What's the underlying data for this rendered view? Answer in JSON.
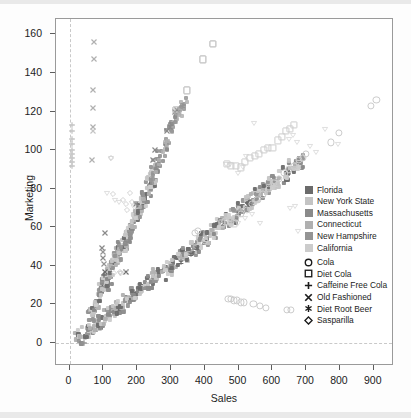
{
  "chart": {
    "type": "scatter",
    "title": "",
    "xlabel": "Sales",
    "ylabel": "Marketing"
  },
  "axes": {
    "x": {
      "label": "Sales",
      "min": -40,
      "max": 960,
      "ticks": [
        0,
        100,
        200,
        300,
        400,
        500,
        600,
        700,
        800,
        900
      ]
    },
    "y": {
      "label": "Marketing",
      "min": -12,
      "max": 168,
      "ticks": [
        0,
        20,
        40,
        60,
        80,
        100,
        120,
        140,
        160
      ]
    },
    "reference_lines": {
      "x_at": 0,
      "y_at": 0
    }
  },
  "legend": {
    "position": "inside-right",
    "color_groups": [
      {
        "label": "Florida",
        "color": "#6b6b6b"
      },
      {
        "label": "New York State",
        "color": "#c4c4c4"
      },
      {
        "label": "Massachusetts",
        "color": "#8a8a8a"
      },
      {
        "label": "Connecticut",
        "color": "#b0b0b0"
      },
      {
        "label": "New Hampshire",
        "color": "#949494"
      },
      {
        "label": "California",
        "color": "#cccccc"
      }
    ],
    "shape_groups": [
      {
        "label": "Cola",
        "symbol": "circle",
        "icon": "circle-icon"
      },
      {
        "label": "Diet Cola",
        "symbol": "square",
        "icon": "square-icon"
      },
      {
        "label": "Caffeine Free Cola",
        "symbol": "plus",
        "icon": "plus-icon"
      },
      {
        "label": "Old Fashioned",
        "symbol": "x",
        "icon": "x-icon"
      },
      {
        "label": "Diet Root Beer",
        "symbol": "asterisk",
        "icon": "asterisk-icon"
      },
      {
        "label": "Sasparilla",
        "symbol": "diamond",
        "icon": "diamond-icon"
      }
    ]
  },
  "chart_data": {
    "type": "scatter",
    "title": "",
    "xlabel": "Sales",
    "ylabel": "Marketing",
    "xlim": [
      -40,
      960
    ],
    "ylim": [
      -12,
      168
    ],
    "xticks": [
      0,
      100,
      200,
      300,
      400,
      500,
      600,
      700,
      800,
      900
    ],
    "yticks": [
      0,
      20,
      40,
      60,
      80,
      100,
      120,
      140,
      160
    ],
    "grid": false,
    "legend_position": "inside-right",
    "color_encoding": "State",
    "shape_encoding": "Product",
    "series": [
      {
        "name": "Old Fashioned",
        "symbol": "x",
        "points": [
          {
            "x": 72,
            "y": 156,
            "color": "#b0b0b0"
          },
          {
            "x": 72,
            "y": 147,
            "color": "#b0b0b0"
          },
          {
            "x": 68,
            "y": 131,
            "color": "#b0b0b0"
          },
          {
            "x": 68,
            "y": 122,
            "color": "#b0b0b0"
          },
          {
            "x": 68,
            "y": 112,
            "color": "#b0b0b0"
          },
          {
            "x": 68,
            "y": 110,
            "color": "#c4c4c4"
          },
          {
            "x": 66,
            "y": 95,
            "color": "#b0b0b0"
          },
          {
            "x": 105,
            "y": 57,
            "color": "#8a8a8a"
          },
          {
            "x": 96,
            "y": 49,
            "color": "#8a8a8a"
          },
          {
            "x": 98,
            "y": 47,
            "color": "#949494"
          },
          {
            "x": 100,
            "y": 44,
            "color": "#8a8a8a"
          },
          {
            "x": 102,
            "y": 41,
            "color": "#949494"
          },
          {
            "x": 104,
            "y": 37,
            "color": "#6b6b6b"
          },
          {
            "x": 168,
            "y": 37,
            "color": "#6b6b6b"
          },
          {
            "x": 196,
            "y": 72,
            "color": "#8a8a8a"
          },
          {
            "x": 248,
            "y": 95,
            "color": "#8a8a8a"
          },
          {
            "x": 252,
            "y": 100,
            "color": "#8a8a8a"
          },
          {
            "x": 288,
            "y": 110,
            "color": "#8a8a8a"
          },
          {
            "x": 296,
            "y": 112,
            "color": "#8a8a8a"
          },
          {
            "x": 312,
            "y": 120,
            "color": "#8a8a8a"
          },
          {
            "x": 318,
            "y": 121,
            "color": "#8a8a8a"
          }
        ]
      },
      {
        "name": "Caffeine Free Cola",
        "symbol": "plus",
        "points": [
          {
            "x": 6,
            "y": 113,
            "color": "#c4c4c4"
          },
          {
            "x": 6,
            "y": 110,
            "color": "#c4c4c4"
          },
          {
            "x": 6,
            "y": 106,
            "color": "#c4c4c4"
          },
          {
            "x": 6,
            "y": 103,
            "color": "#c4c4c4"
          },
          {
            "x": 6,
            "y": 100,
            "color": "#c4c4c4"
          },
          {
            "x": 6,
            "y": 98,
            "color": "#c4c4c4"
          },
          {
            "x": 6,
            "y": 96,
            "color": "#c4c4c4"
          },
          {
            "x": 6,
            "y": 94,
            "color": "#c4c4c4"
          },
          {
            "x": 6,
            "y": 92,
            "color": "#c4c4c4"
          },
          {
            "x": 103,
            "y": 35,
            "color": "#6b6b6b"
          },
          {
            "x": 44,
            "y": 0,
            "color": "#949494"
          }
        ]
      },
      {
        "name": "Sasparilla",
        "symbol": "diamond",
        "points": [
          {
            "x": 178,
            "y": 78,
            "color": "#c4c4c4"
          },
          {
            "x": 186,
            "y": 73,
            "color": "#c4c4c4"
          },
          {
            "x": 190,
            "y": 71,
            "color": "#c4c4c4"
          },
          {
            "x": 170,
            "y": 69,
            "color": "#c4c4c4"
          },
          {
            "x": 132,
            "y": 36,
            "color": "#c4c4c4"
          },
          {
            "x": 152,
            "y": 36,
            "color": "#c4c4c4"
          },
          {
            "x": 130,
            "y": 77,
            "color": "#c4c4c4"
          },
          {
            "x": 158,
            "y": 74,
            "color": "#c4c4c4"
          },
          {
            "x": 166,
            "y": 72,
            "color": "#c4c4c4"
          },
          {
            "x": 122,
            "y": 96,
            "color": "#c4c4c4"
          },
          {
            "x": 150,
            "y": 37,
            "color": "#c4c4c4"
          }
        ]
      },
      {
        "name": "Diet Root Beer",
        "symbol": "asterisk",
        "points": [
          {
            "x": 330,
            "y": 42,
            "color": "#6b6b6b"
          },
          {
            "x": 360,
            "y": 46,
            "color": "#6b6b6b"
          },
          {
            "x": 378,
            "y": 49,
            "color": "#6b6b6b"
          },
          {
            "x": 455,
            "y": 63,
            "color": "#949494"
          },
          {
            "x": 480,
            "y": 63,
            "color": "#949494"
          },
          {
            "x": 500,
            "y": 68,
            "color": "#949494"
          },
          {
            "x": 540,
            "y": 72,
            "color": "#949494"
          }
        ]
      },
      {
        "name": "Diet Cola",
        "symbol": "square",
        "points": [
          {
            "x": 466,
            "y": 93,
            "color": "#cccccc"
          },
          {
            "x": 478,
            "y": 92,
            "color": "#cccccc"
          },
          {
            "x": 492,
            "y": 92,
            "color": "#cccccc"
          },
          {
            "x": 506,
            "y": 91,
            "color": "#cccccc"
          },
          {
            "x": 520,
            "y": 94,
            "color": "#cccccc"
          },
          {
            "x": 534,
            "y": 96,
            "color": "#cccccc"
          },
          {
            "x": 548,
            "y": 97,
            "color": "#cccccc"
          },
          {
            "x": 560,
            "y": 98,
            "color": "#cccccc"
          },
          {
            "x": 574,
            "y": 100,
            "color": "#cccccc"
          },
          {
            "x": 588,
            "y": 101,
            "color": "#cccccc"
          },
          {
            "x": 600,
            "y": 101,
            "color": "#cccccc"
          },
          {
            "x": 616,
            "y": 105,
            "color": "#cccccc"
          },
          {
            "x": 628,
            "y": 107,
            "color": "#cccccc"
          },
          {
            "x": 640,
            "y": 110,
            "color": "#cccccc"
          },
          {
            "x": 652,
            "y": 111,
            "color": "#cccccc"
          },
          {
            "x": 664,
            "y": 113,
            "color": "#cccccc"
          },
          {
            "x": 452,
            "y": 62,
            "color": "#cccccc"
          },
          {
            "x": 470,
            "y": 63,
            "color": "#cccccc"
          },
          {
            "x": 486,
            "y": 62,
            "color": "#cccccc"
          },
          {
            "x": 424,
            "y": 155,
            "color": "#b0b0b0"
          },
          {
            "x": 394,
            "y": 147,
            "color": "#b0b0b0"
          },
          {
            "x": 348,
            "y": 131,
            "color": "#b0b0b0"
          },
          {
            "x": 320,
            "y": 120,
            "color": "#b0b0b0"
          },
          {
            "x": 314,
            "y": 121,
            "color": "#b0b0b0"
          }
        ]
      },
      {
        "name": "Cola",
        "symbol": "circle",
        "points": [
          {
            "x": 908,
            "y": 126,
            "color": "#cccccc"
          },
          {
            "x": 892,
            "y": 123,
            "color": "#cccccc"
          },
          {
            "x": 796,
            "y": 109,
            "color": "#cccccc"
          },
          {
            "x": 774,
            "y": 104,
            "color": "#cccccc"
          },
          {
            "x": 700,
            "y": 98,
            "color": "#cccccc"
          },
          {
            "x": 690,
            "y": 96,
            "color": "#cccccc"
          },
          {
            "x": 678,
            "y": 95,
            "color": "#cccccc"
          },
          {
            "x": 664,
            "y": 92,
            "color": "#cccccc"
          },
          {
            "x": 650,
            "y": 90,
            "color": "#cccccc"
          },
          {
            "x": 636,
            "y": 88,
            "color": "#cccccc"
          },
          {
            "x": 620,
            "y": 85,
            "color": "#cccccc"
          },
          {
            "x": 604,
            "y": 83,
            "color": "#cccccc"
          },
          {
            "x": 590,
            "y": 80,
            "color": "#cccccc"
          },
          {
            "x": 572,
            "y": 77,
            "color": "#cccccc"
          },
          {
            "x": 556,
            "y": 74,
            "color": "#cccccc"
          },
          {
            "x": 540,
            "y": 72,
            "color": "#cccccc"
          },
          {
            "x": 524,
            "y": 69,
            "color": "#cccccc"
          },
          {
            "x": 508,
            "y": 67,
            "color": "#cccccc"
          },
          {
            "x": 492,
            "y": 65,
            "color": "#cccccc"
          },
          {
            "x": 476,
            "y": 63,
            "color": "#cccccc"
          },
          {
            "x": 460,
            "y": 63,
            "color": "#cccccc"
          },
          {
            "x": 400,
            "y": 53,
            "color": "#cccccc"
          },
          {
            "x": 372,
            "y": 57,
            "color": "#cccccc"
          },
          {
            "x": 380,
            "y": 58,
            "color": "#cccccc"
          },
          {
            "x": 470,
            "y": 23,
            "color": "#cccccc"
          },
          {
            "x": 478,
            "y": 23,
            "color": "#cccccc"
          },
          {
            "x": 486,
            "y": 22,
            "color": "#cccccc"
          },
          {
            "x": 496,
            "y": 22,
            "color": "#cccccc"
          },
          {
            "x": 506,
            "y": 21,
            "color": "#cccccc"
          },
          {
            "x": 516,
            "y": 21,
            "color": "#cccccc"
          },
          {
            "x": 544,
            "y": 20,
            "color": "#cccccc"
          },
          {
            "x": 564,
            "y": 19,
            "color": "#cccccc"
          },
          {
            "x": 580,
            "y": 18,
            "color": "#cccccc"
          },
          {
            "x": 644,
            "y": 17,
            "color": "#cccccc"
          },
          {
            "x": 656,
            "y": 17,
            "color": "#cccccc"
          }
        ]
      },
      {
        "name": "Root Beer (triangles)",
        "symbol": "triangle",
        "points": [
          {
            "x": 546,
            "y": 114,
            "color": "#cccccc"
          },
          {
            "x": 756,
            "y": 111,
            "color": "#cccccc"
          },
          {
            "x": 794,
            "y": 103,
            "color": "#cccccc"
          },
          {
            "x": 660,
            "y": 108,
            "color": "#cccccc"
          },
          {
            "x": 648,
            "y": 106,
            "color": "#cccccc"
          },
          {
            "x": 674,
            "y": 104,
            "color": "#cccccc"
          },
          {
            "x": 712,
            "y": 102,
            "color": "#cccccc"
          },
          {
            "x": 728,
            "y": 99,
            "color": "#cccccc"
          },
          {
            "x": 522,
            "y": 97,
            "color": "#cccccc"
          },
          {
            "x": 462,
            "y": 93,
            "color": "#cccccc"
          },
          {
            "x": 476,
            "y": 93,
            "color": "#cccccc"
          },
          {
            "x": 512,
            "y": 91,
            "color": "#cccccc"
          },
          {
            "x": 498,
            "y": 88,
            "color": "#cccccc"
          },
          {
            "x": 540,
            "y": 67,
            "color": "#cccccc"
          },
          {
            "x": 564,
            "y": 62,
            "color": "#cccccc"
          },
          {
            "x": 520,
            "y": 65,
            "color": "#cccccc"
          },
          {
            "x": 498,
            "y": 62,
            "color": "#cccccc"
          },
          {
            "x": 652,
            "y": 70,
            "color": "#cccccc"
          },
          {
            "x": 668,
            "y": 71,
            "color": "#cccccc"
          },
          {
            "x": 676,
            "y": 58,
            "color": "#cccccc"
          },
          {
            "x": 124,
            "y": 96,
            "color": "#cccccc"
          },
          {
            "x": 112,
            "y": 78,
            "color": "#cccccc"
          },
          {
            "x": 134,
            "y": 74,
            "color": "#cccccc"
          },
          {
            "x": 146,
            "y": 73,
            "color": "#cccccc"
          },
          {
            "x": 168,
            "y": 37,
            "color": "#cccccc"
          },
          {
            "x": 148,
            "y": 36,
            "color": "#cccccc"
          }
        ]
      }
    ],
    "dense_cluster_note": "Two dense diagonal bands of small square markers: a steep band rising from (60,10) to (250,88) and a shallower band rising from (30,3) to (690,95)."
  }
}
